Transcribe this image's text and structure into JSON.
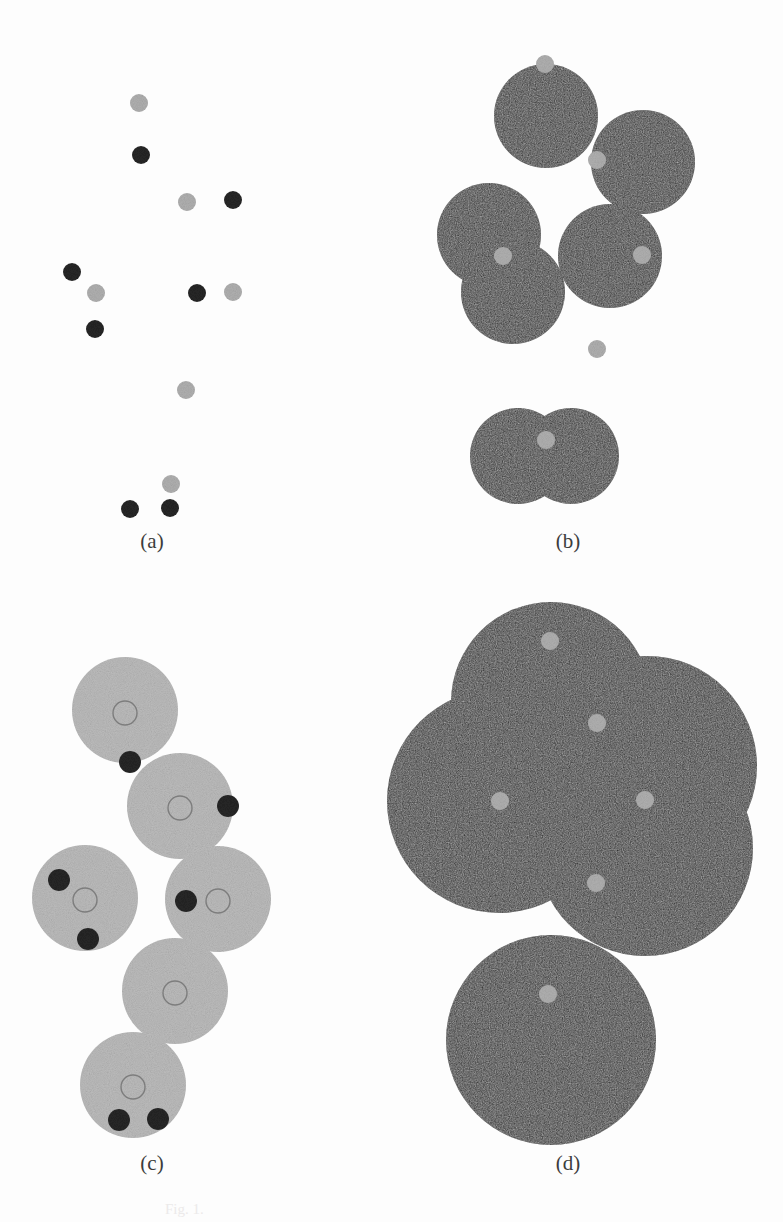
{
  "figure": {
    "title": "",
    "background_color": "#fdfdfd",
    "width": 783,
    "height": 1222,
    "caption_fragment": "Fig. 1."
  },
  "colors": {
    "dark_disk": "#2e2e2e",
    "dark_dot": "#262626",
    "light_disk": "#bcbcbc",
    "light_dot": "#b0b0b0",
    "ring_stroke": "#7d7d7d",
    "label_text": "#3c3c3c"
  },
  "panels": [
    {
      "id": "a",
      "label": "(a)",
      "label_x": 152,
      "label_y": 548,
      "description": "sparse seed particles only"
    },
    {
      "id": "b",
      "label": "(b)",
      "label_x": 568,
      "label_y": 548,
      "description": "partially grown dark disks around seeds"
    },
    {
      "id": "c",
      "label": "(c)",
      "label_x": 152,
      "label_y": 1170,
      "description": "light grown disks with ring cores and dark satellites"
    },
    {
      "id": "d",
      "label": "(d)",
      "label_x": 568,
      "label_y": 1170,
      "description": "large overlapping dark disks covering the field"
    }
  ],
  "chart_data": {
    "type": "scatter",
    "xlabel": "",
    "ylabel": "",
    "panel_a": {
      "dark_dots": [
        {
          "x": 141,
          "y": 155,
          "r": 9
        },
        {
          "x": 233,
          "y": 200,
          "r": 9
        },
        {
          "x": 72,
          "y": 272,
          "r": 9
        },
        {
          "x": 95,
          "y": 329,
          "r": 9
        },
        {
          "x": 197,
          "y": 293,
          "r": 9
        },
        {
          "x": 130,
          "y": 509,
          "r": 9
        },
        {
          "x": 170,
          "y": 508,
          "r": 9
        }
      ],
      "light_dots": [
        {
          "x": 139,
          "y": 103,
          "r": 9
        },
        {
          "x": 187,
          "y": 202,
          "r": 9
        },
        {
          "x": 96,
          "y": 293,
          "r": 9
        },
        {
          "x": 233,
          "y": 292,
          "r": 9
        },
        {
          "x": 186,
          "y": 390,
          "r": 9
        },
        {
          "x": 171,
          "y": 484,
          "r": 9
        }
      ]
    },
    "panel_b": {
      "disks": [
        {
          "cx": 546,
          "cy": 116,
          "r": 52
        },
        {
          "cx": 643,
          "cy": 162,
          "r": 52
        },
        {
          "cx": 489,
          "cy": 235,
          "r": 52
        },
        {
          "cx": 513,
          "cy": 292,
          "r": 52
        },
        {
          "cx": 610,
          "cy": 256,
          "r": 52
        },
        {
          "cx": 518,
          "cy": 456,
          "r": 48
        },
        {
          "cx": 571,
          "cy": 456,
          "r": 48
        }
      ],
      "light_dots": [
        {
          "x": 545,
          "y": 64,
          "r": 9
        },
        {
          "x": 597,
          "y": 160,
          "r": 9
        },
        {
          "x": 503,
          "y": 256,
          "r": 9
        },
        {
          "x": 642,
          "y": 255,
          "r": 9
        },
        {
          "x": 597,
          "y": 349,
          "r": 9
        },
        {
          "x": 546,
          "y": 440,
          "r": 9
        }
      ]
    },
    "panel_c": {
      "disks": [
        {
          "cx": 125,
          "cy": 710,
          "r": 53
        },
        {
          "cx": 180,
          "cy": 806,
          "r": 53
        },
        {
          "cx": 85,
          "cy": 898,
          "r": 53
        },
        {
          "cx": 218,
          "cy": 899,
          "r": 53
        },
        {
          "cx": 175,
          "cy": 991,
          "r": 53
        },
        {
          "cx": 133,
          "cy": 1085,
          "r": 53
        }
      ],
      "rings": [
        {
          "cx": 125,
          "cy": 713,
          "r": 12
        },
        {
          "cx": 180,
          "cy": 808,
          "r": 12
        },
        {
          "cx": 85,
          "cy": 900,
          "r": 12
        },
        {
          "cx": 218,
          "cy": 901,
          "r": 12
        },
        {
          "cx": 175,
          "cy": 993,
          "r": 12
        },
        {
          "cx": 133,
          "cy": 1087,
          "r": 12
        }
      ],
      "dark_dots": [
        {
          "x": 130,
          "y": 762,
          "r": 11
        },
        {
          "x": 228,
          "y": 806,
          "r": 11
        },
        {
          "x": 59,
          "y": 880,
          "r": 11
        },
        {
          "x": 88,
          "y": 939,
          "r": 11
        },
        {
          "x": 186,
          "y": 901,
          "r": 11
        },
        {
          "x": 119,
          "y": 1120,
          "r": 11
        },
        {
          "x": 158,
          "y": 1119,
          "r": 11
        }
      ]
    },
    "panel_d": {
      "disks": [
        {
          "cx": 551,
          "cy": 702,
          "r": 100
        },
        {
          "cx": 647,
          "cy": 766,
          "r": 110
        },
        {
          "cx": 499,
          "cy": 801,
          "r": 112
        },
        {
          "cx": 645,
          "cy": 848,
          "r": 108
        },
        {
          "cx": 551,
          "cy": 1040,
          "r": 105
        }
      ],
      "light_dots": [
        {
          "x": 550,
          "y": 641,
          "r": 9
        },
        {
          "x": 597,
          "y": 723,
          "r": 9
        },
        {
          "x": 500,
          "y": 801,
          "r": 9
        },
        {
          "x": 645,
          "y": 800,
          "r": 9
        },
        {
          "x": 596,
          "y": 883,
          "r": 9
        },
        {
          "x": 548,
          "y": 994,
          "r": 9
        }
      ]
    }
  }
}
